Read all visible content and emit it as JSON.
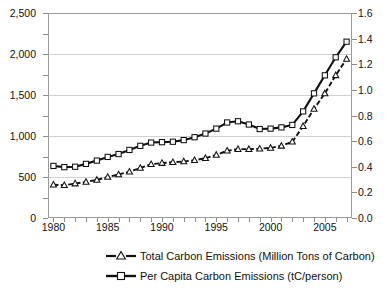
{
  "chart_data": {
    "type": "line",
    "title": "",
    "xlabel": "",
    "ylabel": "",
    "y2label": "",
    "grid": true,
    "legend_position": "bottom",
    "x": [
      1980,
      1981,
      1982,
      1983,
      1984,
      1985,
      1986,
      1987,
      1988,
      1989,
      1990,
      1991,
      1992,
      1993,
      1994,
      1995,
      1996,
      1997,
      1998,
      1999,
      2000,
      2001,
      2002,
      2003,
      2004,
      2005,
      2006,
      2007
    ],
    "xlim": [
      1979.5,
      2007.5
    ],
    "xticks": [
      1980,
      1985,
      1990,
      1995,
      2000,
      2005
    ],
    "xticklabels": [
      "1980",
      "1985",
      "1990",
      "1995",
      "2000",
      "2005"
    ],
    "ylim": [
      0,
      2500
    ],
    "yticks": [
      0,
      500,
      1000,
      1500,
      2000,
      2500
    ],
    "yticklabels": [
      "0",
      "500",
      "1,000",
      "1,500",
      "2,000",
      "2,500"
    ],
    "y2lim": [
      0.0,
      1.6
    ],
    "y2ticks": [
      0.0,
      0.2,
      0.4,
      0.6,
      0.8,
      1.0,
      1.2,
      1.4,
      1.6
    ],
    "y2ticklabels": [
      "0.0",
      "0.2",
      "0.4",
      "0.6",
      "0.8",
      "1.0",
      "1.2",
      "1.4",
      "1.6"
    ],
    "series": [
      {
        "name": "Total Carbon Emissions (Million Tons of Carbon)",
        "axis": "left",
        "marker": "triangle",
        "linestyle": "dashed",
        "color": "#111111",
        "values": [
          405,
          400,
          420,
          440,
          465,
          500,
          530,
          565,
          610,
          655,
          670,
          680,
          690,
          705,
          730,
          770,
          820,
          840,
          840,
          845,
          855,
          880,
          930,
          1120,
          1330,
          1520,
          1740,
          1940
        ]
      },
      {
        "name": "Per Capita Carbon Emissions (tC/person)",
        "axis": "left",
        "marker": "square",
        "linestyle": "solid",
        "color": "#111111",
        "values": [
          635,
          620,
          625,
          660,
          700,
          745,
          780,
          830,
          880,
          920,
          925,
          930,
          950,
          985,
          1030,
          1090,
          1165,
          1180,
          1140,
          1085,
          1090,
          1105,
          1135,
          1300,
          1520,
          1740,
          1960,
          2150
        ]
      }
    ]
  },
  "legend": {
    "items": [
      {
        "label": "Total Carbon Emissions (Million Tons of Carbon)",
        "marker": "triangle",
        "linestyle": "dashed"
      },
      {
        "label": "Per Capita Carbon Emissions (tC/person)",
        "marker": "square",
        "linestyle": "solid"
      }
    ]
  }
}
